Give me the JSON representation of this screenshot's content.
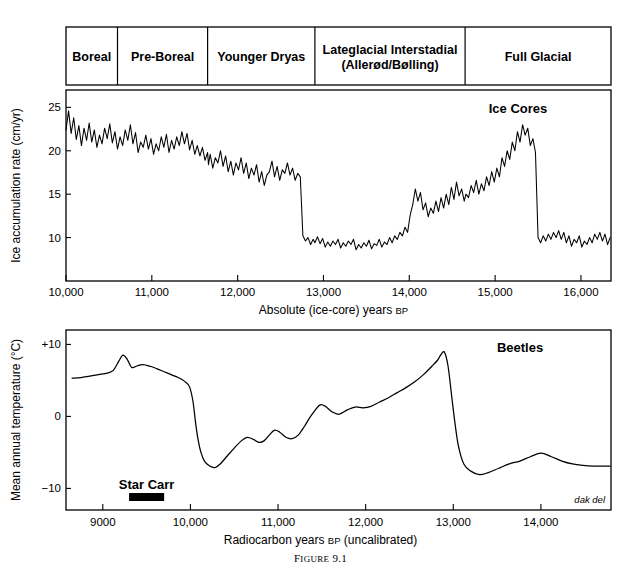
{
  "figure": {
    "caption_lead": "F",
    "caption_rest": "IGURE",
    "caption_number": "9.1",
    "caption_full": "Figure 9.1",
    "credit": "dak del"
  },
  "period_bar": {
    "periods": [
      {
        "label": "Boreal",
        "sub": "",
        "start": 10000,
        "end": 10600
      },
      {
        "label": "Pre-Boreal",
        "sub": "",
        "start": 10600,
        "end": 11650
      },
      {
        "label": "Younger Dryas",
        "sub": "",
        "start": 11650,
        "end": 12900
      },
      {
        "label": "Lateglacial Interstadial",
        "sub": "(Allerød/Bølling)",
        "start": 12900,
        "end": 14650
      },
      {
        "label": "Full Glacial",
        "sub": "",
        "start": 14650,
        "end": 16350
      }
    ]
  },
  "chart_data": [
    {
      "type": "line",
      "name": "ice-cores",
      "title": "Ice Cores",
      "xlabel": "Absolute (ice-core) years BP",
      "xlabel_main": "Absolute (ice-core) years ",
      "xlabel_sub": "BP",
      "ylabel": "Ice accumulation rate (cm/yr)",
      "xlim": [
        10000,
        16350
      ],
      "ylim": [
        5,
        27
      ],
      "xticks": [
        10000,
        11000,
        12000,
        13000,
        14000,
        15000,
        16000
      ],
      "xticklabels": [
        "10,000",
        "11,000",
        "12,000",
        "13,000",
        "14,000",
        "15,000",
        "16,000"
      ],
      "yticks": [
        10,
        15,
        20,
        25
      ],
      "yticklabels": [
        "10",
        "15",
        "20",
        "25"
      ],
      "grid": false,
      "x": [
        10000,
        10030,
        10060,
        10090,
        10120,
        10150,
        10180,
        10210,
        10240,
        10270,
        10300,
        10330,
        10360,
        10390,
        10420,
        10450,
        10480,
        10510,
        10540,
        10570,
        10600,
        10630,
        10660,
        10690,
        10720,
        10750,
        10780,
        10810,
        10840,
        10870,
        10900,
        10930,
        10960,
        10990,
        11020,
        11050,
        11080,
        11110,
        11140,
        11170,
        11200,
        11230,
        11260,
        11290,
        11320,
        11350,
        11380,
        11410,
        11440,
        11470,
        11500,
        11530,
        11560,
        11590,
        11620,
        11650,
        11660,
        11680,
        11710,
        11740,
        11770,
        11800,
        11830,
        11860,
        11890,
        11920,
        11950,
        11980,
        12010,
        12040,
        12070,
        12100,
        12130,
        12160,
        12190,
        12220,
        12250,
        12280,
        12310,
        12340,
        12370,
        12400,
        12430,
        12460,
        12490,
        12520,
        12550,
        12580,
        12610,
        12640,
        12670,
        12700,
        12730,
        12760,
        12790,
        12820,
        12850,
        12880,
        12900,
        12930,
        12960,
        12990,
        13020,
        13050,
        13080,
        13110,
        13140,
        13170,
        13200,
        13230,
        13260,
        13290,
        13320,
        13350,
        13380,
        13410,
        13440,
        13470,
        13500,
        13530,
        13560,
        13590,
        13620,
        13650,
        13680,
        13710,
        13740,
        13770,
        13800,
        13830,
        13860,
        13890,
        13920,
        13950,
        13980,
        14010,
        14040,
        14070,
        14100,
        14130,
        14160,
        14190,
        14220,
        14250,
        14280,
        14310,
        14340,
        14370,
        14400,
        14430,
        14460,
        14490,
        14520,
        14550,
        14580,
        14610,
        14640,
        14660,
        14690,
        14720,
        14750,
        14780,
        14810,
        14840,
        14870,
        14900,
        14930,
        14960,
        14990,
        15020,
        15050,
        15080,
        15110,
        15140,
        15170,
        15200,
        15230,
        15260,
        15290,
        15320,
        15350,
        15380,
        15410,
        15440,
        15470,
        15500,
        15530,
        15560,
        15590,
        15620,
        15650,
        15680,
        15710,
        15740,
        15770,
        15800,
        15830,
        15860,
        15890,
        15920,
        15950,
        15980,
        16010,
        16040,
        16070,
        16100,
        16130,
        16160,
        16190,
        16220,
        16250,
        16280,
        16310,
        16340
      ],
      "y": [
        22.4,
        24.6,
        22.0,
        23.8,
        21.3,
        22.9,
        20.6,
        22.6,
        21.2,
        23.2,
        21.0,
        22.4,
        20.4,
        21.8,
        20.8,
        22.6,
        21.4,
        23.1,
        20.9,
        22.2,
        20.2,
        21.6,
        20.6,
        22.4,
        21.2,
        23.0,
        20.8,
        22.1,
        19.8,
        21.0,
        20.4,
        21.8,
        20.2,
        21.4,
        19.6,
        20.8,
        20.0,
        21.6,
        20.4,
        21.9,
        19.8,
        21.2,
        20.2,
        21.6,
        20.6,
        22.2,
        20.8,
        22.0,
        20.1,
        21.2,
        19.6,
        20.6,
        19.4,
        20.4,
        18.9,
        19.8,
        18.4,
        19.6,
        18.0,
        19.2,
        18.6,
        20.0,
        18.2,
        19.4,
        17.6,
        18.8,
        17.2,
        18.6,
        17.8,
        19.2,
        17.4,
        18.6,
        16.8,
        18.0,
        17.2,
        18.4,
        16.4,
        17.6,
        16.0,
        17.2,
        17.6,
        18.8,
        17.0,
        18.2,
        16.6,
        17.8,
        17.4,
        18.6,
        17.2,
        18.0,
        16.6,
        17.4,
        17.0,
        10.2,
        9.6,
        10.0,
        9.2,
        9.8,
        9.4,
        10.1,
        9.3,
        9.9,
        8.9,
        9.5,
        9.0,
        9.6,
        9.2,
        9.8,
        8.8,
        9.4,
        9.0,
        9.6,
        9.2,
        9.8,
        8.6,
        9.2,
        8.8,
        9.4,
        9.0,
        9.7,
        8.7,
        9.3,
        9.1,
        9.8,
        8.9,
        9.5,
        9.2,
        10.0,
        9.4,
        10.2,
        9.8,
        10.6,
        10.2,
        11.2,
        10.6,
        12.6,
        13.8,
        15.6,
        14.2,
        15.2,
        13.2,
        14.0,
        12.4,
        13.4,
        12.8,
        14.2,
        13.0,
        14.6,
        13.4,
        15.0,
        13.8,
        15.8,
        14.4,
        16.4,
        14.8,
        15.6,
        14.2,
        15.0,
        14.6,
        16.0,
        15.2,
        16.6,
        15.0,
        16.2,
        15.4,
        17.0,
        16.0,
        17.6,
        16.4,
        18.0,
        17.0,
        19.2,
        18.2,
        20.0,
        19.0,
        21.0,
        20.0,
        22.2,
        21.0,
        23.0,
        21.8,
        22.6,
        20.6,
        21.4,
        19.8,
        10.0,
        9.4,
        10.2,
        9.6,
        10.4,
        9.8,
        10.6,
        10.0,
        10.8,
        9.8,
        10.6,
        9.4,
        10.2,
        9.0,
        9.8,
        9.4,
        10.2,
        8.9,
        9.6,
        9.2,
        10.0,
        9.4,
        10.4,
        9.8,
        10.6,
        9.6,
        10.4,
        9.2,
        10.0,
        9.4,
        10.2,
        9.0,
        9.8,
        9.4,
        10.2,
        9.8,
        10.8,
        10.2,
        11.0,
        10.4,
        11.2,
        10.6,
        11.4,
        10.8,
        11.6
      ]
    },
    {
      "type": "line",
      "name": "beetles",
      "title": "Beetles",
      "xlabel": "Radiocarbon years BP (uncalibrated)",
      "xlabel_main": "Radiocarbon years ",
      "xlabel_sub": "BP",
      "xlabel_tail": " (uncalibrated)",
      "ylabel": "Mean annual temperature (°C)",
      "xlim": [
        8580,
        14800
      ],
      "ylim": [
        -13,
        12
      ],
      "xticks": [
        9000,
        10000,
        11000,
        12000,
        13000,
        14000
      ],
      "xticklabels": [
        "9000",
        "10,000",
        "11,000",
        "12,000",
        "13,000",
        "14,000"
      ],
      "yticks": [
        -10,
        0,
        10
      ],
      "yticklabels": [
        "−10",
        "0",
        "+10"
      ],
      "grid": false,
      "x": [
        8650,
        8750,
        8850,
        8950,
        9050,
        9120,
        9180,
        9230,
        9280,
        9330,
        9390,
        9450,
        9500,
        9560,
        9620,
        9700,
        9780,
        9860,
        9930,
        9990,
        10030,
        10060,
        10090,
        10120,
        10160,
        10220,
        10280,
        10340,
        10420,
        10500,
        10580,
        10650,
        10720,
        10780,
        10840,
        10900,
        10960,
        11020,
        11090,
        11160,
        11230,
        11300,
        11360,
        11420,
        11480,
        11540,
        11620,
        11700,
        11790,
        11880,
        11970,
        12060,
        12160,
        12260,
        12360,
        12460,
        12560,
        12660,
        12750,
        12820,
        12860,
        12900,
        12940,
        12980,
        13020,
        13060,
        13120,
        13200,
        13300,
        13400,
        13520,
        13640,
        13760,
        13880,
        14000,
        14120,
        14240,
        14360,
        14480,
        14600,
        14720,
        14790
      ],
      "y": [
        5.3,
        5.4,
        5.6,
        5.8,
        6.0,
        6.4,
        7.6,
        8.5,
        7.9,
        6.8,
        7.0,
        7.2,
        7.1,
        6.9,
        6.6,
        6.2,
        5.8,
        5.4,
        4.9,
        4.1,
        2.0,
        -1.0,
        -3.4,
        -5.0,
        -6.2,
        -6.9,
        -7.1,
        -6.6,
        -5.5,
        -4.4,
        -3.4,
        -2.9,
        -3.2,
        -3.6,
        -3.4,
        -2.6,
        -1.9,
        -2.2,
        -2.9,
        -3.1,
        -2.6,
        -1.4,
        -0.2,
        0.8,
        1.6,
        1.4,
        0.6,
        0.3,
        0.9,
        1.3,
        1.2,
        1.4,
        2.0,
        2.6,
        3.3,
        4.0,
        4.8,
        5.8,
        6.9,
        7.8,
        8.6,
        8.9,
        7.0,
        3.0,
        -1.0,
        -4.2,
        -6.6,
        -7.6,
        -8.1,
        -7.8,
        -7.2,
        -6.6,
        -6.2,
        -5.6,
        -5.1,
        -5.6,
        -6.2,
        -6.6,
        -6.8,
        -6.9,
        -6.9,
        -6.9
      ]
    }
  ],
  "annotations": {
    "star_carr": {
      "label": "Star Carr",
      "bar_start": 9300,
      "bar_end": 9700
    }
  }
}
